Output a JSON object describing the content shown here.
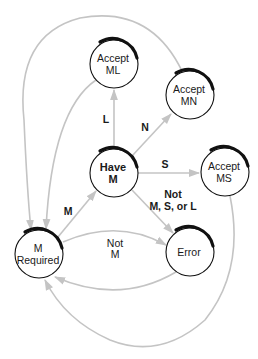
{
  "diagram": {
    "type": "state-machine",
    "colors": {
      "edge": "#c4c4c4",
      "node_stroke": "#111111",
      "text": "#1a1a1a",
      "background": "#ffffff"
    },
    "nodes": {
      "accept_ml": {
        "line1": "Accept",
        "line2": "ML"
      },
      "accept_mn": {
        "line1": "Accept",
        "line2": "MN"
      },
      "have_m": {
        "line1": "Have",
        "line2": "M"
      },
      "accept_ms": {
        "line1": "Accept",
        "line2": "MS"
      },
      "m_required": {
        "line1": "M",
        "line2": "Required"
      },
      "error": {
        "line1": "Error"
      }
    },
    "edges": {
      "have_m_to_accept_ml": {
        "label": "L"
      },
      "have_m_to_accept_mn": {
        "label": "N"
      },
      "have_m_to_accept_ms": {
        "label": "S"
      },
      "have_m_to_error": {
        "line1": "Not",
        "line2": "M, S, or L"
      },
      "m_required_to_have_m": {
        "label": "M"
      },
      "m_required_to_error": {
        "line1": "Not",
        "line2": "M"
      },
      "error_to_m_required": {
        "label": ""
      },
      "accept_ml_to_m_required": {
        "label": ""
      },
      "accept_mn_to_m_required": {
        "label": ""
      },
      "accept_ms_to_m_required": {
        "label": ""
      }
    }
  }
}
